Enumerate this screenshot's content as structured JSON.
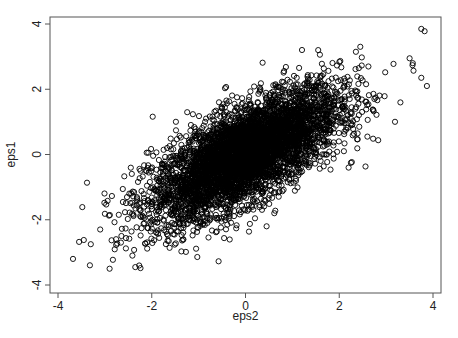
{
  "chart_data": {
    "type": "scatter",
    "title": "",
    "xlabel": "eps2",
    "ylabel": "eps1",
    "xlim": [
      -4.2,
      4.2
    ],
    "ylim": [
      -4.2,
      4.2
    ],
    "xticks": [
      -4,
      -2,
      0,
      2,
      4
    ],
    "yticks": [
      -4,
      -2,
      0,
      2,
      4
    ],
    "xtick_labels": [
      "-4",
      "-2",
      "0",
      "2",
      "4"
    ],
    "ytick_labels": [
      "-4",
      "-2",
      "0",
      "2",
      "4"
    ],
    "grid": false,
    "legend": null,
    "marker": "hollow-circle",
    "marker_color": "#000000",
    "series": [
      {
        "name": "eps1 vs eps2",
        "distribution": "bivariate-normal",
        "n_points": 5000,
        "mean_x": 0.0,
        "mean_y": 0.0,
        "sd_x": 1.0,
        "sd_y": 1.0,
        "correlation": 0.7,
        "approx_range_x": [
          -3.7,
          3.9
        ],
        "approx_range_y": [
          -3.5,
          3.9
        ],
        "notable_points": [
          {
            "x": 3.75,
            "y": 3.85
          },
          {
            "x": 3.82,
            "y": 3.78
          },
          {
            "x": 3.5,
            "y": 2.95
          },
          {
            "x": 3.57,
            "y": 2.8
          },
          {
            "x": 3.75,
            "y": 2.35
          },
          {
            "x": 3.87,
            "y": 2.1
          },
          {
            "x": -3.55,
            "y": -2.68
          },
          {
            "x": -3.68,
            "y": -3.2
          },
          {
            "x": -3.45,
            "y": -2.62
          },
          {
            "x": -3.3,
            "y": -2.75
          },
          {
            "x": -2.9,
            "y": -3.5
          },
          {
            "x": -2.35,
            "y": -3.45
          },
          {
            "x": -3.1,
            "y": -2.3
          },
          {
            "x": 2.2,
            "y": -0.4
          },
          {
            "x": 0.45,
            "y": -2.2
          },
          {
            "x": 2.6,
            "y": 0.55
          },
          {
            "x": 2.1,
            "y": 0.1
          },
          {
            "x": 1.55,
            "y": 3.2
          },
          {
            "x": 2.45,
            "y": 3.3
          }
        ]
      }
    ]
  },
  "labels": {
    "x_axis_title": "eps2",
    "y_axis_title": "eps1"
  }
}
